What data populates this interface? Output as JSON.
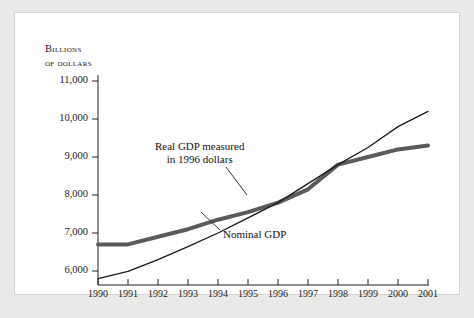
{
  "figure": {
    "background_color": "#e9e9e7",
    "card_color": "#ffffff",
    "axis_title_line1": "Billions",
    "axis_title_line2": "of dollars"
  },
  "chart_data": {
    "type": "line",
    "title": "",
    "xlabel": "",
    "ylabel": "Billions of dollars",
    "xlim": [
      1990,
      2001
    ],
    "ylim": [
      5600,
      11000
    ],
    "grid": false,
    "legend_position": "inline-annotations",
    "x": [
      1990,
      1991,
      1992,
      1993,
      1994,
      1995,
      1996,
      1997,
      1998,
      1999,
      2000,
      2001
    ],
    "xtick_labels": [
      "1990",
      "1991",
      "1992",
      "1993",
      "1994",
      "1995",
      "1996",
      "1997",
      "1998",
      "1999",
      "2000",
      "2001"
    ],
    "ytick_values": [
      6000,
      7000,
      8000,
      9000,
      10000,
      11000
    ],
    "ytick_labels": [
      "6,000",
      "7,000",
      "8,000",
      "9,000",
      "10,000",
      "11,000"
    ],
    "series": [
      {
        "name": "Real GDP measured in 1996 dollars",
        "color": "#5a5a5a",
        "line_width": 4,
        "values": [
          6700,
          6700,
          6900,
          7100,
          7350,
          7550,
          7800,
          8150,
          8800,
          9000,
          9200,
          9300
        ]
      },
      {
        "name": "Nominal GDP",
        "color": "#1a1a1a",
        "line_width": 1.3,
        "values": [
          5800,
          5990,
          6300,
          6640,
          7000,
          7400,
          7800,
          8300,
          8800,
          9250,
          9800,
          10200
        ]
      }
    ],
    "annotations": [
      {
        "name": "real-gdp-annotation",
        "line1": "Real GDP measured",
        "line2": "in 1996 dollars",
        "leader_from": [
          211,
          154
        ],
        "leader_to": [
          232,
          182
        ]
      },
      {
        "name": "nominal-gdp-annotation",
        "line1": "Nominal GDP",
        "line2": "",
        "leader_from": [
          205,
          217
        ],
        "leader_to": [
          186,
          199
        ]
      }
    ]
  }
}
